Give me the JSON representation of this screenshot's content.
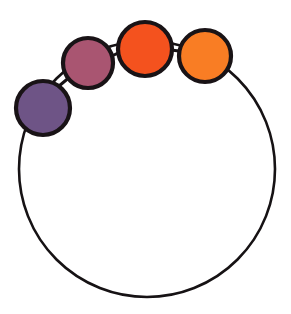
{
  "figure": {
    "background_color": "#ffffff",
    "width": 291,
    "height": 314,
    "outline_color": "#161214",
    "outline_width": 2.6
  },
  "chart_data": {
    "type": "diagram",
    "ring": {
      "label": "main-circle",
      "center_x": 147,
      "center_y": 169,
      "radius": 128,
      "stroke": "#161214",
      "stroke_width": 2.6,
      "fill": "none"
    },
    "nodes": [
      {
        "label": "purple-node",
        "order": 1,
        "center_x": 43,
        "center_y": 108,
        "radius": 27,
        "fill": "#6E5486",
        "stroke": "#191316",
        "stroke_width": 4.2,
        "angle_deg": 208
      },
      {
        "label": "magenta-node",
        "order": 2,
        "center_x": 88,
        "center_y": 63,
        "radius": 25,
        "fill": "#A95571",
        "stroke": "#191316",
        "stroke_width": 4.2,
        "angle_deg": 232
      },
      {
        "label": "red-orange-node",
        "order": 3,
        "center_x": 145,
        "center_y": 49,
        "radius": 27,
        "fill": "#F4521E",
        "stroke": "#191316",
        "stroke_width": 4.2,
        "angle_deg": 269
      },
      {
        "label": "orange-node",
        "order": 4,
        "center_x": 205,
        "center_y": 56,
        "radius": 26,
        "fill": "#F97D24",
        "stroke": "#191316",
        "stroke_width": 4.2,
        "angle_deg": 295
      }
    ],
    "connectors": [
      {
        "label": "connector-purple-magenta",
        "x1": 59,
        "y1": 86,
        "x2": 71,
        "y2": 76,
        "stroke": "#161214",
        "stroke_width": 3
      },
      {
        "label": "connector-magenta-redorange",
        "x1": 112,
        "y1": 56,
        "x2": 120,
        "y2": 52,
        "stroke": "#161214",
        "stroke_width": 3
      },
      {
        "label": "connector-redorange-orange",
        "x1": 171,
        "y1": 50,
        "x2": 179,
        "y2": 51,
        "stroke": "#161214",
        "stroke_width": 3
      }
    ],
    "colors": {
      "purple": "#6E5486",
      "magenta": "#A95571",
      "red_orange": "#F4521E",
      "orange": "#F97D24",
      "outline": "#161214",
      "background": "#ffffff"
    },
    "node_count": 4,
    "xlim": [
      0,
      291
    ],
    "ylim": [
      0,
      314
    ],
    "grid": false,
    "legend": false,
    "axis_visible": false
  }
}
